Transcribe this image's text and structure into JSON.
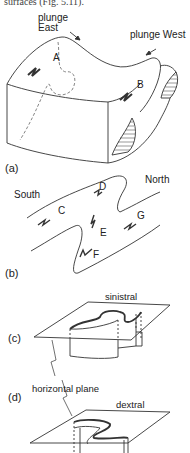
{
  "header": {
    "cropped_text": "surfaces (Fig. 5.11)."
  },
  "panels": {
    "a": {
      "label": "(a)",
      "annotations": {
        "plunge_east_1": "plunge",
        "plunge_east_2": "East",
        "plunge_west": "plunge West",
        "A": "A",
        "B": "B"
      }
    },
    "b": {
      "label": "(b)",
      "annotations": {
        "south": "South",
        "north": "North",
        "C": "C",
        "D": "D",
        "E": "E",
        "F": "F",
        "G": "G"
      }
    },
    "c": {
      "label": "(c)",
      "annotations": {
        "sense": "sinistral"
      }
    },
    "d": {
      "label": "(d)",
      "annotations": {
        "sense": "dextral",
        "plane": "horizontal plane"
      }
    }
  },
  "colors": {
    "line": "#333333",
    "dashed": "#777777",
    "text": "#222222"
  }
}
